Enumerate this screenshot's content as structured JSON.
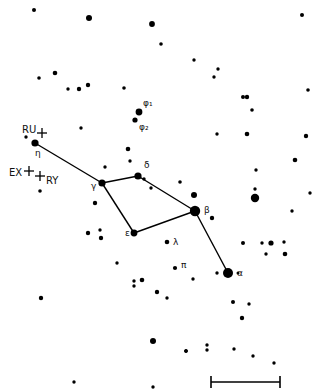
{
  "chart_data": {
    "type": "star-chart",
    "title": "",
    "background": "#ffffff",
    "ink": "#000000",
    "named_stars": [
      {
        "id": "eta",
        "label": "η",
        "x": 35,
        "y": 143,
        "r": 3.6,
        "label_dx": 0,
        "label_dy": 13
      },
      {
        "id": "gamma",
        "label": "γ",
        "x": 102,
        "y": 183,
        "r": 3.6,
        "label_dx": -11,
        "label_dy": 6
      },
      {
        "id": "delta",
        "label": "δ",
        "x": 138,
        "y": 176,
        "r": 3.6,
        "label_dx": 6,
        "label_dy": -8
      },
      {
        "id": "beta",
        "label": "β",
        "x": 195,
        "y": 211,
        "r": 5.2,
        "label_dx": 9,
        "label_dy": 2
      },
      {
        "id": "epsilon",
        "label": "ε",
        "x": 134,
        "y": 233,
        "r": 3.4,
        "label_dx": -9,
        "label_dy": 3
      },
      {
        "id": "lambda",
        "label": "λ",
        "x": 167,
        "y": 242,
        "r": 2.3,
        "label_dx": 6,
        "label_dy": 3
      },
      {
        "id": "pi",
        "label": "π",
        "x": 175,
        "y": 268,
        "r": 2.1,
        "label_dx": 6,
        "label_dy": 0
      },
      {
        "id": "alpha",
        "label": "α",
        "x": 228,
        "y": 273,
        "r": 5.0,
        "label_dx": 9,
        "label_dy": 3
      },
      {
        "id": "phi1",
        "label": "φ₁",
        "x": 139,
        "y": 112,
        "r": 3.4,
        "label_dx": 4,
        "label_dy": -6
      },
      {
        "id": "phi2",
        "label": "φ₂",
        "x": 135,
        "y": 120,
        "r": 2.6,
        "label_dx": 4,
        "label_dy": 10
      }
    ],
    "constellation_lines": [
      [
        "eta",
        "gamma"
      ],
      [
        "gamma",
        "delta"
      ],
      [
        "delta",
        "beta"
      ],
      [
        "gamma",
        "epsilon"
      ],
      [
        "epsilon",
        "beta"
      ],
      [
        "beta",
        "alpha"
      ]
    ],
    "variable_markers": [
      {
        "id": "RU",
        "label": "RU",
        "x": 42,
        "y": 133,
        "label_x": 22,
        "label_y": 133
      },
      {
        "id": "EX",
        "label": "EX",
        "x": 29,
        "y": 171,
        "label_x": 9,
        "label_y": 176
      },
      {
        "id": "RY",
        "label": "RY",
        "x": 40,
        "y": 176,
        "label_x": 46,
        "label_y": 184
      }
    ],
    "field_stars": [
      {
        "x": 34,
        "y": 10,
        "r": 2.0
      },
      {
        "x": 89,
        "y": 18,
        "r": 3.0
      },
      {
        "x": 152,
        "y": 24,
        "r": 2.9
      },
      {
        "x": 302,
        "y": 15,
        "r": 2.0
      },
      {
        "x": 161,
        "y": 44,
        "r": 1.8
      },
      {
        "x": 39,
        "y": 78,
        "r": 1.8
      },
      {
        "x": 55,
        "y": 73,
        "r": 2.3
      },
      {
        "x": 68,
        "y": 89,
        "r": 1.7
      },
      {
        "x": 79,
        "y": 89,
        "r": 2.2
      },
      {
        "x": 88,
        "y": 85,
        "r": 2.2
      },
      {
        "x": 194,
        "y": 60,
        "r": 1.7
      },
      {
        "x": 218,
        "y": 69,
        "r": 1.7
      },
      {
        "x": 214,
        "y": 77,
        "r": 1.7
      },
      {
        "x": 243,
        "y": 97,
        "r": 2.0
      },
      {
        "x": 247,
        "y": 97,
        "r": 2.2
      },
      {
        "x": 308,
        "y": 90,
        "r": 1.8
      },
      {
        "x": 252,
        "y": 110,
        "r": 1.8
      },
      {
        "x": 124,
        "y": 88,
        "r": 1.8
      },
      {
        "x": 81,
        "y": 128,
        "r": 1.7
      },
      {
        "x": 26,
        "y": 137,
        "r": 1.7
      },
      {
        "x": 217,
        "y": 134,
        "r": 1.7
      },
      {
        "x": 247,
        "y": 134,
        "r": 2.3
      },
      {
        "x": 306,
        "y": 136,
        "r": 2.2
      },
      {
        "x": 295,
        "y": 160,
        "r": 2.3
      },
      {
        "x": 128,
        "y": 149,
        "r": 2.3
      },
      {
        "x": 130,
        "y": 161,
        "r": 1.7
      },
      {
        "x": 105,
        "y": 167,
        "r": 1.7
      },
      {
        "x": 144,
        "y": 179,
        "r": 1.7
      },
      {
        "x": 151,
        "y": 188,
        "r": 1.7
      },
      {
        "x": 180,
        "y": 182,
        "r": 1.8
      },
      {
        "x": 256,
        "y": 170,
        "r": 1.7
      },
      {
        "x": 255,
        "y": 189,
        "r": 1.7
      },
      {
        "x": 255,
        "y": 198,
        "r": 4.2
      },
      {
        "x": 310,
        "y": 193,
        "r": 1.7
      },
      {
        "x": 292,
        "y": 211,
        "r": 1.7
      },
      {
        "x": 194,
        "y": 195,
        "r": 3.0
      },
      {
        "x": 212,
        "y": 218,
        "r": 2.2
      },
      {
        "x": 40,
        "y": 191,
        "r": 1.8
      },
      {
        "x": 95,
        "y": 203,
        "r": 2.2
      },
      {
        "x": 88,
        "y": 233,
        "r": 2.2
      },
      {
        "x": 100,
        "y": 230,
        "r": 1.7
      },
      {
        "x": 101,
        "y": 238,
        "r": 2.2
      },
      {
        "x": 117,
        "y": 263,
        "r": 1.7
      },
      {
        "x": 243,
        "y": 243,
        "r": 2.0
      },
      {
        "x": 262,
        "y": 243,
        "r": 1.7
      },
      {
        "x": 271,
        "y": 243,
        "r": 2.6
      },
      {
        "x": 284,
        "y": 242,
        "r": 1.7
      },
      {
        "x": 266,
        "y": 254,
        "r": 1.7
      },
      {
        "x": 285,
        "y": 254,
        "r": 2.3
      },
      {
        "x": 238,
        "y": 273,
        "r": 1.5
      },
      {
        "x": 233,
        "y": 302,
        "r": 2.0
      },
      {
        "x": 249,
        "y": 304,
        "r": 1.7
      },
      {
        "x": 242,
        "y": 318,
        "r": 2.2
      },
      {
        "x": 41,
        "y": 298,
        "r": 2.2
      },
      {
        "x": 134,
        "y": 281,
        "r": 1.7
      },
      {
        "x": 134,
        "y": 286,
        "r": 1.7
      },
      {
        "x": 142,
        "y": 280,
        "r": 2.3
      },
      {
        "x": 157,
        "y": 292,
        "r": 2.2
      },
      {
        "x": 167,
        "y": 298,
        "r": 1.7
      },
      {
        "x": 193,
        "y": 279,
        "r": 1.7
      },
      {
        "x": 217,
        "y": 273,
        "r": 1.7
      },
      {
        "x": 153,
        "y": 341,
        "r": 3.0
      },
      {
        "x": 186,
        "y": 351,
        "r": 1.7
      },
      {
        "x": 207,
        "y": 345,
        "r": 1.7
      },
      {
        "x": 186,
        "y": 351,
        "r": 1.7
      },
      {
        "x": 74,
        "y": 382,
        "r": 1.7
      },
      {
        "x": 153,
        "y": 387,
        "r": 1.7
      },
      {
        "x": 186,
        "y": 351,
        "r": 1.7
      },
      {
        "x": 207,
        "y": 350,
        "r": 1.7
      },
      {
        "x": 234,
        "y": 349,
        "r": 1.7
      },
      {
        "x": 253,
        "y": 356,
        "r": 1.7
      },
      {
        "x": 274,
        "y": 363,
        "r": 1.7
      }
    ],
    "scale_bar": {
      "x1": 211,
      "x2": 280,
      "y": 382,
      "tick_half": 6
    }
  }
}
